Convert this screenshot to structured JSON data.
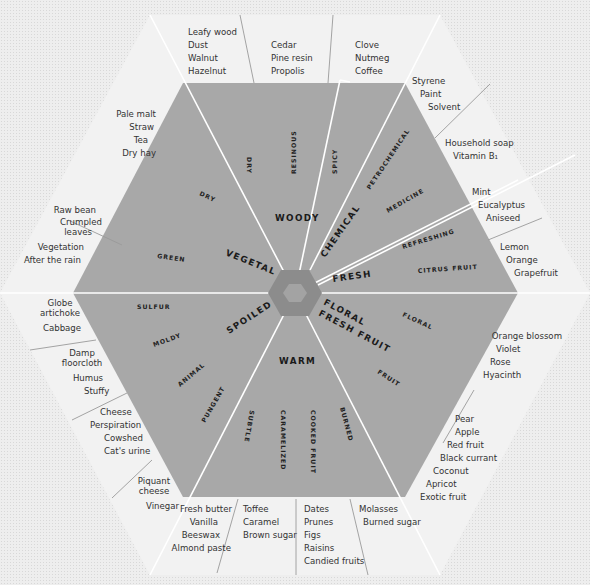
{
  "diagram": {
    "colors": {
      "background": "#eeeeee",
      "outer_ring": "#f2f2f2",
      "inner_area": "#a8a8a8",
      "center_hex": "#8c8c8c",
      "center_core": "#a3a3a3",
      "divider": "#ffffff"
    },
    "families": [
      {
        "name": "WOODY",
        "subcategories": [
          {
            "name": "DRY",
            "descriptors": [
              "Leafy wood",
              "Dust",
              "Walnut",
              "Hazelnut"
            ]
          },
          {
            "name": "RESINOUS",
            "descriptors": [
              "Cedar",
              "Pine resin",
              "Propolis"
            ]
          },
          {
            "name": "SPICY",
            "descriptors": [
              "Clove",
              "Nutmeg",
              "Coffee"
            ]
          }
        ]
      },
      {
        "name": "CHEMICAL",
        "subcategories": [
          {
            "name": "PETROCHEMICAL",
            "descriptors": [
              "Styrene",
              "Paint",
              "Solvent"
            ]
          },
          {
            "name": "MEDICINE",
            "descriptors": [
              "Household soap",
              "Vitamin B1"
            ]
          }
        ]
      },
      {
        "name": "FRESH",
        "subcategories": [
          {
            "name": "REFRESHING",
            "descriptors": [
              "Mint",
              "Eucalyptus",
              "Aniseed"
            ]
          },
          {
            "name": "CITRUS FRUIT",
            "descriptors": [
              "Lemon",
              "Orange",
              "Grapefruit"
            ]
          }
        ]
      },
      {
        "name": "FLORAL FRESH FRUIT",
        "subcategories": [
          {
            "name": "FLORAL",
            "descriptors": [
              "Orange blossom",
              "Violet",
              "Rose",
              "Hyacinth"
            ]
          },
          {
            "name": "FRUIT",
            "descriptors": [
              "Pear",
              "Apple",
              "Red fruit",
              "Black currant",
              "Coconut",
              "Apricot",
              "Exotic fruit"
            ]
          }
        ]
      },
      {
        "name": "WARM",
        "subcategories": [
          {
            "name": "SUBTLE",
            "descriptors": [
              "Fresh butter",
              "Vanilla",
              "Beeswax",
              "Almond paste"
            ]
          },
          {
            "name": "CARAMELIZED",
            "descriptors": [
              "Toffee",
              "Caramel",
              "Brown sugar"
            ]
          },
          {
            "name": "COOKED FRUIT",
            "descriptors": [
              "Dates",
              "Prunes",
              "Figs",
              "Raisins",
              "Candied fruits"
            ]
          },
          {
            "name": "BURNED",
            "descriptors": [
              "Molasses",
              "Burned sugar"
            ]
          }
        ]
      },
      {
        "name": "SPOILED",
        "subcategories": [
          {
            "name": "SULFUR",
            "descriptors": [
              "Globe artichoke",
              "Cabbage"
            ]
          },
          {
            "name": "MOLDY",
            "descriptors": [
              "Damp floorcloth",
              "Humus",
              "Stuffy"
            ]
          },
          {
            "name": "ANIMAL",
            "descriptors": [
              "Cheese",
              "Perspiration",
              "Cowshed",
              "Cat's urine"
            ]
          },
          {
            "name": "PUNGENT",
            "descriptors": [
              "Piquant cheese",
              "Vinegar"
            ]
          }
        ]
      },
      {
        "name": "VEGETAL",
        "subcategories": [
          {
            "name": "GREEN",
            "descriptors": [
              "Raw bean",
              "Crumpled leaves",
              "Vegetation",
              "After the rain"
            ]
          },
          {
            "name": "DRY",
            "descriptors": [
              "Pale malt",
              "Straw",
              "Tea",
              "Dry hay"
            ]
          }
        ]
      }
    ]
  },
  "labels": {
    "main": {
      "woody": "WOODY",
      "chemical": "CHEMICAL",
      "fresh": "FRESH",
      "floral1": "FLORAL",
      "floral2": "FRESH FRUIT",
      "warm": "WARM",
      "spoiled": "SPOILED",
      "vegetal": "VEGETAL"
    },
    "sub": {
      "dry_woody": "DRY",
      "resinous": "RESINOUS",
      "spicy": "SPICY",
      "petrochemical": "PETROCHEMICAL",
      "medicine": "MEDICINE",
      "refreshing": "REFRESHING",
      "citrus": "CITRUS FRUIT",
      "floral": "FLORAL",
      "fruit": "FRUIT",
      "subtle": "SUBTLE",
      "caramelized": "CARAMELIZED",
      "cooked": "COOKED FRUIT",
      "burned": "BURNED",
      "pungent": "PUNGENT",
      "animal": "ANIMAL",
      "moldy": "MOLDY",
      "sulfur": "SULFUR",
      "green": "GREEN",
      "dry_vegetal": "DRY"
    },
    "desc": {
      "dry_woody": [
        "Leafy wood",
        "Dust",
        "Walnut",
        "Hazelnut"
      ],
      "resinous": [
        "Cedar",
        "Pine resin",
        "Propolis"
      ],
      "spicy": [
        "Clove",
        "Nutmeg",
        "Coffee"
      ],
      "petrochemical": [
        "Styrene",
        "Paint",
        "Solvent"
      ],
      "medicine": [
        "Household soap",
        "Vitamin B₁"
      ],
      "refreshing": [
        "Mint",
        "Eucalyptus",
        "Aniseed"
      ],
      "citrus": [
        "Lemon",
        "Orange",
        "Grapefruit"
      ],
      "floral": [
        "Orange blossom",
        "Violet",
        "Rose",
        "Hyacinth"
      ],
      "fruit": [
        "Pear",
        "Apple",
        "Red fruit",
        "Black currant",
        "Coconut",
        "Apricot",
        "Exotic fruit"
      ],
      "burned": [
        "Molasses",
        "Burned sugar"
      ],
      "cooked": [
        "Dates",
        "Prunes",
        "Figs",
        "Raisins",
        "Candied fruits"
      ],
      "caramelized": [
        "Toffee",
        "Caramel",
        "Brown sugar"
      ],
      "subtle": [
        "Fresh butter",
        "Vanilla",
        "Beeswax",
        "Almond paste"
      ],
      "pungent": [
        "Piquant",
        "cheese",
        "Vinegar"
      ],
      "animal": [
        "Cheese",
        "Perspiration",
        "Cowshed",
        "Cat's urine"
      ],
      "moldy": [
        "Damp",
        "floorcloth",
        "Humus",
        "Stuffy"
      ],
      "sulfur": [
        "Globe",
        "artichoke",
        "Cabbage"
      ],
      "green": [
        "Raw bean",
        "Crumpled",
        "leaves",
        "Vegetation",
        "After the rain"
      ],
      "dry_vegetal": [
        "Pale malt",
        "Straw",
        "Tea",
        "Dry hay"
      ]
    }
  }
}
